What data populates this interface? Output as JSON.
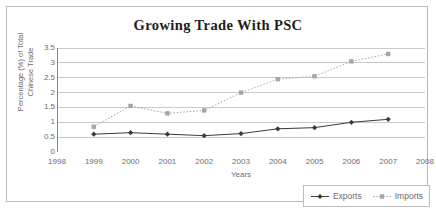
{
  "chart_data": {
    "type": "line",
    "title": "Growing Trade With PSC",
    "xlabel": "Years",
    "ylabel_line1": "Percentage (%) of Total",
    "ylabel_line2": "Chinese Trade",
    "x": [
      1999,
      2000,
      2001,
      2002,
      2003,
      2004,
      2005,
      2006,
      2007
    ],
    "xticks": [
      "1998",
      "1999",
      "2000",
      "2001",
      "2002",
      "2003",
      "2004",
      "2005",
      "2006",
      "2007",
      "2008"
    ],
    "yticks": [
      "0",
      "0.5",
      "1",
      "1.5",
      "2",
      "2.5",
      "3",
      "3.5"
    ],
    "xlim": [
      1998,
      2008
    ],
    "ylim": [
      0,
      3.5
    ],
    "grid": true,
    "legend_position": "bottom-right",
    "series": [
      {
        "name": "Exports",
        "values": [
          0.6,
          0.65,
          0.6,
          0.55,
          0.62,
          0.78,
          0.82,
          1.0,
          1.1
        ],
        "color": "#3a3a3a",
        "marker": "diamond",
        "linestyle": "solid"
      },
      {
        "name": "Imports",
        "values": [
          0.85,
          1.55,
          1.3,
          1.4,
          2.0,
          2.45,
          2.55,
          3.05,
          3.3
        ],
        "color": "#a6a6a6",
        "marker": "square",
        "linestyle": "dotted"
      }
    ]
  },
  "legend": {
    "items": [
      {
        "label": "Exports"
      },
      {
        "label": "Imports"
      }
    ]
  },
  "colors": {
    "frame_border": "#b9b9b9",
    "gridline": "#c9c9c9",
    "axis": "#8a8a8a",
    "tick_text": "#6e6e6e",
    "title_text": "#1d1d1d"
  }
}
